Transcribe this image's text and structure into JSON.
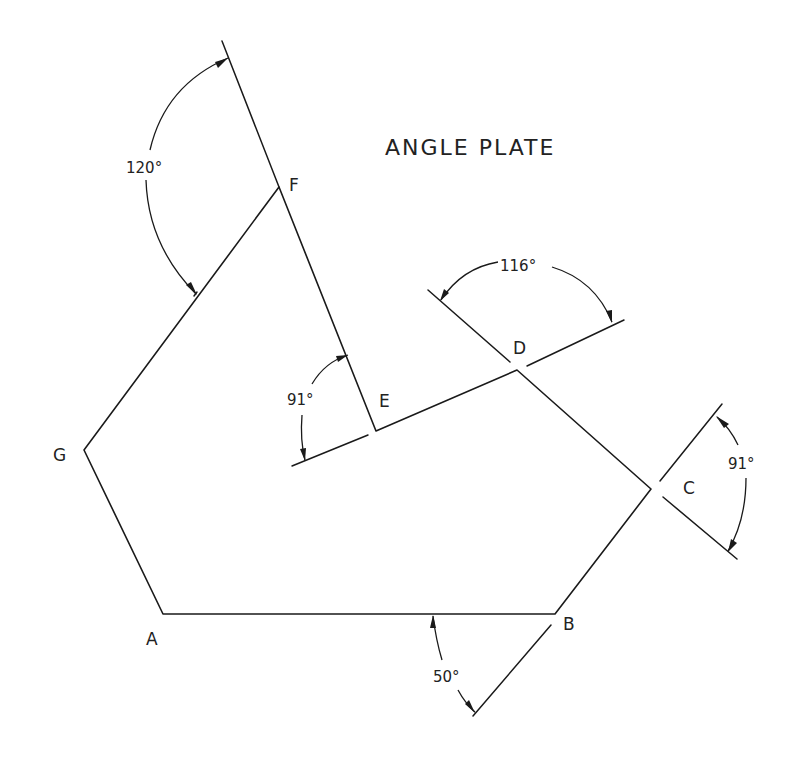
{
  "title": "ANGLE PLATE",
  "vertices": {
    "A": "A",
    "B": "B",
    "C": "C",
    "D": "D",
    "E": "E",
    "F": "F",
    "G": "G"
  },
  "angles": {
    "F": "120°",
    "D": "116°",
    "E": "91°",
    "C": "91°",
    "B": "50°"
  },
  "colors": {
    "line": "#1a1a1a",
    "background": "#ffffff"
  }
}
